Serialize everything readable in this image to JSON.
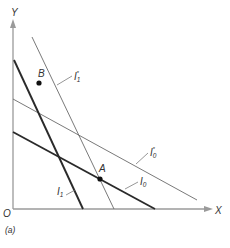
{
  "figure": {
    "panel_label": "(a)",
    "axes": {
      "x_label": "X",
      "y_label": "Y",
      "origin_label": "O"
    },
    "lines": [
      {
        "id": "I1",
        "label": "I",
        "sub": "1",
        "star": false,
        "weight": "thick"
      },
      {
        "id": "I0",
        "label": "I",
        "sub": "0",
        "star": false,
        "weight": "thick"
      },
      {
        "id": "I1star",
        "label": "I",
        "sub": "1",
        "star": true,
        "weight": "thin"
      },
      {
        "id": "I0star",
        "label": "I",
        "sub": "0",
        "star": true,
        "weight": "thin"
      }
    ],
    "points": [
      {
        "id": "A",
        "label": "A"
      },
      {
        "id": "B",
        "label": "B"
      }
    ],
    "colors": {
      "thick": "#2a2a2a",
      "thin": "#6a6a6a",
      "axis": "#9a9a9a"
    },
    "star_symbol": "*"
  }
}
